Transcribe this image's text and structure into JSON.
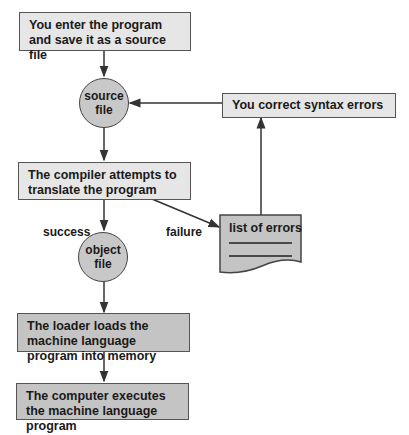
{
  "diagram": {
    "type": "flowchart",
    "nodes": {
      "enter_program": "You enter the program and save it as a source file",
      "source_file": {
        "line1": "source",
        "line2": "file"
      },
      "compiler": "The compiler attempts to translate the program",
      "object_file": {
        "line1": "object",
        "line2": "file"
      },
      "loader": "The loader loads the machine language program into memory",
      "execute": "The computer executes the machine language program",
      "correct_errors": "You correct syntax errors",
      "list_of_errors": "list of errors"
    },
    "edge_labels": {
      "success": "success",
      "failure": "failure"
    },
    "colors": {
      "light_box": "#e6e6e6",
      "dark_box": "#c4c4c4",
      "circle": "#c8c8c8",
      "stroke": "#444444"
    }
  }
}
